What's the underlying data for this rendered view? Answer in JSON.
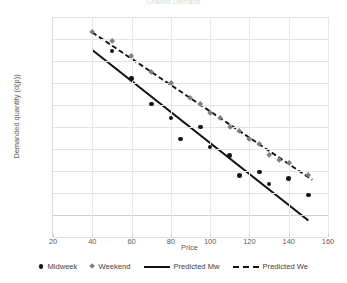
{
  "chart_data": {
    "type": "scatter",
    "title": "Graded Demand",
    "xlabel": "Price",
    "ylabel": "Demanded quantity (d(p))",
    "xlim": [
      20,
      160
    ],
    "ylim": [
      -200,
      1800
    ],
    "xticks": [
      20,
      40,
      60,
      80,
      100,
      120,
      140,
      160
    ],
    "yticks": [
      -200,
      0,
      200,
      400,
      600,
      800,
      1000,
      1200,
      1400,
      1600,
      1800
    ],
    "grid": true,
    "legend_position": "bottom",
    "series": [
      {
        "name": "Midweek",
        "type": "scatter",
        "marker": "circle",
        "color": "#161616",
        "points": [
          [
            50,
            1490
          ],
          [
            60,
            1240
          ],
          [
            70,
            1010
          ],
          [
            80,
            880
          ],
          [
            85,
            690
          ],
          [
            95,
            800
          ],
          [
            100,
            620
          ],
          [
            110,
            540
          ],
          [
            115,
            360
          ],
          [
            125,
            390
          ],
          [
            130,
            280
          ],
          [
            140,
            330
          ],
          [
            150,
            180
          ]
        ]
      },
      {
        "name": "Weekend",
        "type": "scatter",
        "marker": "diamond",
        "color": "#7f7f7f",
        "points": [
          [
            40,
            1660
          ],
          [
            50,
            1580
          ],
          [
            60,
            1440
          ],
          [
            70,
            1300
          ],
          [
            80,
            1200
          ],
          [
            90,
            1060
          ],
          [
            95,
            1010
          ],
          [
            100,
            930
          ],
          [
            105,
            880
          ],
          [
            110,
            800
          ],
          [
            115,
            760
          ],
          [
            120,
            690
          ],
          [
            125,
            640
          ],
          [
            130,
            540
          ],
          [
            135,
            500
          ],
          [
            140,
            470
          ],
          [
            150,
            360
          ]
        ]
      },
      {
        "name": "Predicted Mw",
        "type": "line",
        "style": "solid",
        "color": "#111111",
        "points": [
          [
            40,
            1500
          ],
          [
            150,
            -50
          ]
        ]
      },
      {
        "name": "Predicted We",
        "type": "line",
        "style": "dashed",
        "color": "#111111",
        "points": [
          [
            40,
            1660
          ],
          [
            152,
            320
          ]
        ]
      }
    ]
  },
  "legend": {
    "items": [
      {
        "label": "Midweek",
        "icon": "circle-marker-icon"
      },
      {
        "label": "Weekend",
        "icon": "diamond-marker-icon"
      },
      {
        "label": "Predicted Mw",
        "icon": "solid-line-icon"
      },
      {
        "label": "Predicted We",
        "icon": "dashed-line-icon"
      }
    ]
  }
}
